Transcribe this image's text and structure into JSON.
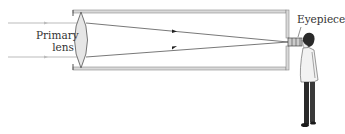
{
  "diagram": {
    "labels": {
      "primary_lens_line1": "Primary",
      "primary_lens_line2": "lens",
      "eyepiece": "Eyepiece"
    },
    "colors": {
      "tube_outline": "#8a8a8a",
      "tube_fill": "#d9d9d9",
      "lens_fill": "#e6e6e6",
      "lens_stroke": "#555555",
      "ray": "#555555",
      "incoming_ray": "#aaaaaa",
      "text": "#333333",
      "coat": "#f2f2f2",
      "pants": "#2a2a2a"
    }
  }
}
